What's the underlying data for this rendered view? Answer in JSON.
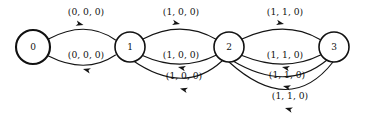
{
  "diagram": {
    "type": "state-transition-diagram",
    "title": "",
    "background_color": "#ffffff",
    "stroke_color": "#111111",
    "nodes": [
      {
        "id": "n0",
        "label": "0",
        "cx": 33,
        "cy": 47,
        "r": 17,
        "stroke_width": 2.1
      },
      {
        "id": "n1",
        "label": "1",
        "cx": 130,
        "cy": 47,
        "r": 15,
        "stroke_width": 1.6
      },
      {
        "id": "n2",
        "label": "2",
        "cx": 229,
        "cy": 47,
        "r": 15,
        "stroke_width": 1.6
      },
      {
        "id": "n3",
        "label": "3",
        "cx": 334,
        "cy": 47,
        "r": 15,
        "stroke_width": 1.6
      }
    ],
    "edges": [
      {
        "id": "e0-1-top",
        "from": "0",
        "to": "1",
        "label": "(0, 0, 0)",
        "direction": "forward",
        "label_x": 86,
        "label_y": 12,
        "path": "M 48.5 39 Q 86 19 115.5 40",
        "arrow_x": 83.5,
        "arrow_y": 25.0,
        "arrow_angle": 14
      },
      {
        "id": "e1-0-bottom",
        "from": "1",
        "to": "0",
        "label": "(0, 0, 0)",
        "direction": "backward",
        "label_x": 86,
        "label_y": 55,
        "path": "M 115.5 55 Q 86 75 48.5 56",
        "arrow_x": 83.0,
        "arrow_y": 69.0,
        "arrow_angle": 194
      },
      {
        "id": "e1-2-top",
        "from": "1",
        "to": "2",
        "label": "(1, 0, 0)",
        "direction": "forward",
        "label_x": 181,
        "label_y": 12,
        "path": "M 143 39 Q 181 19 216.5 39.5",
        "arrow_x": 180.0,
        "arrow_y": 24.0,
        "arrow_angle": 12
      },
      {
        "id": "e2-1-mid",
        "from": "2",
        "to": "1",
        "label": "(1, 0, 0)",
        "direction": "backward",
        "label_x": 181,
        "label_y": 55,
        "path": "M 216.5 55 Q 181 73 142.5 55.5",
        "arrow_x": 178.0,
        "arrow_y": 67.0,
        "arrow_angle": 193
      },
      {
        "id": "e2-1-low",
        "from": "2",
        "to": "1",
        "label": "(1, 0, 0)",
        "direction": "backward",
        "label_x": 184,
        "label_y": 76,
        "path": "M 222 61 Q 184 96 132 60",
        "arrow_x": 180.0,
        "arrow_y": 88.5,
        "arrow_angle": 195
      },
      {
        "id": "e2-3-top",
        "from": "2",
        "to": "3",
        "label": "(1, 1, 0)",
        "direction": "forward",
        "label_x": 285,
        "label_y": 12,
        "path": "M 242 39 Q 285 19 320 39.5",
        "arrow_x": 284.0,
        "arrow_y": 24.0,
        "arrow_angle": 12
      },
      {
        "id": "e3-2-mid",
        "from": "3",
        "to": "2",
        "label": "(1, 1, 0)",
        "direction": "backward",
        "label_x": 285,
        "label_y": 55,
        "path": "M 320.5 55 Q 285 73 242 55.5",
        "arrow_x": 282.0,
        "arrow_y": 67.0,
        "arrow_angle": 193
      },
      {
        "id": "e3-2-low",
        "from": "3",
        "to": "2",
        "label": "(1, 1, 0)",
        "direction": "backward",
        "label_x": 287,
        "label_y": 75,
        "path": "M 327 60 Q 287 93 233 61",
        "arrow_x": 283.0,
        "arrow_y": 86.0,
        "arrow_angle": 195
      },
      {
        "id": "e3-2-lowest",
        "from": "3",
        "to": "2",
        "label": "(1, 1, 0)",
        "direction": "backward",
        "label_x": 290,
        "label_y": 96,
        "path": "M 333 62 Q 290 117 229 62",
        "arrow_x": 285.0,
        "arrow_y": 108.0,
        "arrow_angle": 196
      }
    ]
  }
}
